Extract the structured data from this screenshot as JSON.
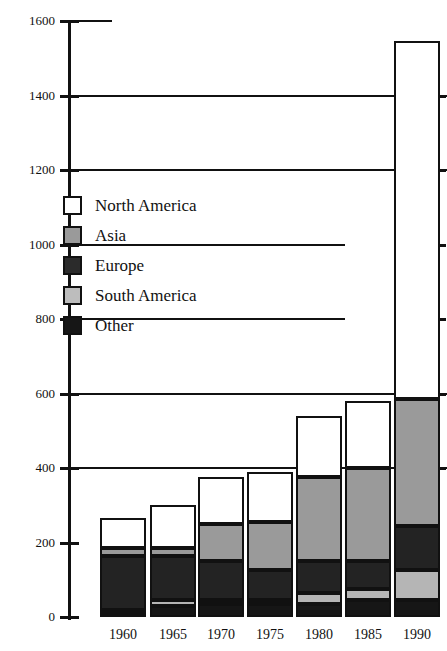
{
  "chart_data": {
    "type": "bar",
    "subtype": "stacked-bar",
    "title": "",
    "xlabel": "",
    "ylabel": "",
    "categories": [
      "1960",
      "1965",
      "1970",
      "1975",
      "1980",
      "1985",
      "1990"
    ],
    "ylim": [
      0,
      1600
    ],
    "yticks": [
      0,
      200,
      400,
      600,
      800,
      1000,
      1200,
      1400,
      1600
    ],
    "ytick_labels": [
      "0",
      "200",
      "400",
      "600",
      "800",
      "1000",
      "1200",
      "1400",
      "1600"
    ],
    "gridlines_at": [
      400,
      600,
      1200,
      1400
    ],
    "grid": true,
    "legend_position": "upper-left",
    "stack_order_bottom_to_top": [
      "Other",
      "South America",
      "Europe",
      "Asia",
      "North America"
    ],
    "series": [
      {
        "name": "North America",
        "color": "#ffffff",
        "values": [
          80,
          115,
          125,
          135,
          165,
          180,
          960
        ]
      },
      {
        "name": "Asia",
        "color": "#9a9a9a",
        "values": [
          20,
          20,
          100,
          130,
          225,
          250,
          340
        ]
      },
      {
        "name": "Europe",
        "color": "#232323",
        "values": [
          145,
          120,
          105,
          80,
          85,
          75,
          120
        ]
      },
      {
        "name": "South America",
        "color": "#b5b5b5",
        "values": [
          10,
          15,
          10,
          10,
          30,
          30,
          80
        ]
      },
      {
        "name": "Other",
        "color": "#161616",
        "values": [
          10,
          30,
          35,
          35,
          35,
          45,
          45
        ]
      }
    ],
    "totals": [
      265,
      300,
      375,
      390,
      540,
      580,
      1545
    ]
  },
  "legend": {
    "items": [
      {
        "label": "North America",
        "key": "north_america",
        "swatch": "white-square-swatch"
      },
      {
        "label": "Asia",
        "key": "asia",
        "swatch": "gray-square-swatch"
      },
      {
        "label": "Europe",
        "key": "europe",
        "swatch": "dark-square-swatch"
      },
      {
        "label": "South America",
        "key": "south_america",
        "swatch": "light-gray-square-swatch"
      },
      {
        "label": "Other",
        "key": "other",
        "swatch": "black-square-swatch"
      }
    ]
  },
  "axis": {
    "y_axis_name": "y-axis",
    "x_axis_name": "x-axis"
  }
}
